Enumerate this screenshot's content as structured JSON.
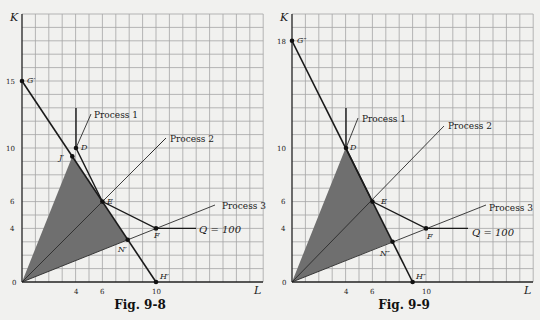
{
  "figures": [
    {
      "caption": "Fig. 9-8",
      "y_axis_label": "K",
      "x_axis_label": "L",
      "y_ticks": [
        "15",
        "10",
        "6",
        "4",
        "0"
      ],
      "x_ticks": [
        "4",
        "6",
        "10"
      ],
      "process_labels": [
        "Process 1",
        "Process 2",
        "Process 3"
      ],
      "isoquant_label": "Q = 100",
      "point_labels": {
        "G": "G′",
        "H": "H′",
        "J": "J′",
        "N": "N′",
        "D": "D",
        "E": "E",
        "F": "F"
      }
    },
    {
      "caption": "Fig. 9-9",
      "y_axis_label": "K",
      "x_axis_label": "L",
      "y_ticks": [
        "18",
        "10",
        "6",
        "4",
        "0"
      ],
      "x_ticks": [
        "4",
        "6",
        "10"
      ],
      "process_labels": [
        "Process 1",
        "Process 2",
        "Process 3"
      ],
      "isoquant_label": "Q = 100",
      "point_labels": {
        "G": "G″",
        "H": "H″",
        "N": "N″",
        "D": "D",
        "E": "E",
        "F": "F"
      }
    }
  ],
  "chart_data": [
    {
      "type": "line",
      "title": "Fig. 9-8",
      "xlabel": "L",
      "ylabel": "K",
      "xlim": [
        0,
        18
      ],
      "ylim": [
        0,
        20
      ],
      "grid": true,
      "isoquant_Q100": [
        [
          4,
          13
        ],
        [
          4,
          10
        ],
        [
          6,
          6
        ],
        [
          10,
          4
        ],
        [
          14,
          4
        ]
      ],
      "process_rays": {
        "Process 1": "K = 2.5L",
        "Process 2": "K = L",
        "Process 3": "K = 0.4L"
      },
      "isocost_line": {
        "from": "G′",
        "to": "H′",
        "points": [
          [
            0,
            15
          ],
          [
            10,
            0
          ]
        ]
      },
      "points": {
        "D": [
          4,
          10
        ],
        "E": [
          6,
          6
        ],
        "F": [
          10,
          4
        ],
        "G′": [
          0,
          15
        ],
        "H′": [
          10,
          0
        ],
        "J′": [
          3.75,
          9.375
        ],
        "N′": [
          7.89,
          3.16
        ]
      },
      "shaded_region": [
        [
          0,
          0
        ],
        [
          3.75,
          9.375
        ],
        [
          7.89,
          3.16
        ]
      ]
    },
    {
      "type": "line",
      "title": "Fig. 9-9",
      "xlabel": "L",
      "ylabel": "K",
      "xlim": [
        0,
        18
      ],
      "ylim": [
        0,
        20
      ],
      "grid": true,
      "isoquant_Q100": [
        [
          4,
          13
        ],
        [
          4,
          10
        ],
        [
          6,
          6
        ],
        [
          10,
          4
        ],
        [
          14,
          4
        ]
      ],
      "process_rays": {
        "Process 1": "K = 2.5L",
        "Process 2": "K = L",
        "Process 3": "K = 0.4L"
      },
      "isocost_line": {
        "from": "G″",
        "to": "H″",
        "points": [
          [
            0,
            18
          ],
          [
            9,
            0
          ]
        ]
      },
      "points": {
        "D": [
          4,
          10
        ],
        "E": [
          6,
          6
        ],
        "F": [
          10,
          4
        ],
        "G″": [
          0,
          18
        ],
        "H″": [
          9,
          0
        ],
        "N″": [
          7.5,
          3
        ]
      },
      "shaded_region": [
        [
          0,
          0
        ],
        [
          4,
          10
        ],
        [
          7.5,
          3
        ]
      ]
    }
  ]
}
